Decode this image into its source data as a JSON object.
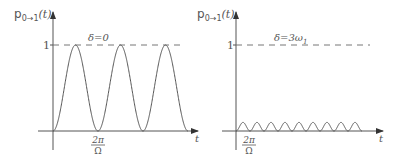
{
  "chart_data": [
    {
      "type": "line",
      "title": "",
      "ylabel": "p0→1(t)",
      "xlabel": "t",
      "annotation": "δ=0",
      "yticks": [
        "1"
      ],
      "xticks": [
        "2π/Ω"
      ],
      "ylim": [
        0,
        1
      ],
      "grid": false,
      "reference_line": {
        "y": 1,
        "style": "dashed"
      },
      "series": [
        {
          "name": "p0→1(t)",
          "description": "sin² oscillation with full amplitude 1, period 2π/Ω, three full periods shown",
          "x": [
            0,
            0.5,
            1,
            1.5,
            2,
            2.5,
            3
          ],
          "x_unit": "2π/Ω",
          "values": [
            0,
            1,
            0,
            1,
            0,
            1,
            0
          ]
        }
      ]
    },
    {
      "type": "line",
      "title": "",
      "ylabel": "p0→1(t)",
      "xlabel": "t",
      "annotation": "δ=3ω1",
      "yticks": [
        "1"
      ],
      "xticks": [
        "2π/Ω"
      ],
      "ylim": [
        0,
        1
      ],
      "grid": false,
      "reference_line": {
        "y": 1,
        "style": "dashed"
      },
      "series": [
        {
          "name": "p0→1(t)",
          "description": "small-amplitude fast oscillation (max ≈0.1), about 9 periods shown",
          "x": [
            0,
            0.5,
            1,
            1.5,
            2,
            2.5,
            3,
            3.5,
            4,
            4.5,
            5,
            5.5,
            6,
            6.5,
            7,
            7.5,
            8,
            8.5,
            9
          ],
          "x_unit": "2π/Ω",
          "values": [
            0,
            0.1,
            0,
            0.1,
            0,
            0.1,
            0,
            0.1,
            0,
            0.1,
            0,
            0.1,
            0,
            0.1,
            0,
            0.1,
            0,
            0.1,
            0
          ]
        }
      ]
    }
  ],
  "left": {
    "ylabel_main": "p",
    "ylabel_sub": "0→1",
    "ylabel_arg": "(t)",
    "ytick": "1",
    "annotation": "δ=0",
    "xtick_num": "2π",
    "xtick_den": "Ω",
    "xlabel": "t"
  },
  "right": {
    "ylabel_main": "p",
    "ylabel_sub": "0→1",
    "ylabel_arg": "(t)",
    "ytick": "1",
    "annotation_main": "δ=3ω",
    "annotation_sub": "1",
    "xtick_num": "2π",
    "xtick_den": "Ω",
    "xlabel": "t"
  }
}
